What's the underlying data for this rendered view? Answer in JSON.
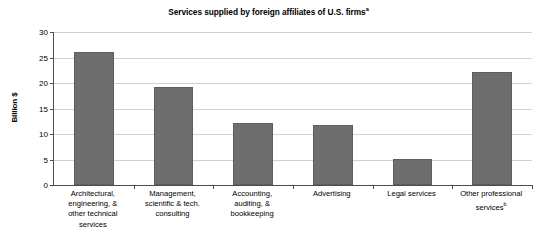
{
  "chart_data": {
    "type": "bar",
    "title": "Services supplied by foreign affiliates of U.S. firms",
    "title_superscript": "a",
    "xlabel": "",
    "ylabel": "Billion $",
    "ylim": [
      0,
      30
    ],
    "ytick_step": 5,
    "yticks": [
      0,
      5,
      10,
      15,
      20,
      25,
      30
    ],
    "ytick_labels": [
      "0",
      "5",
      "10",
      "15",
      "20",
      "25",
      "30"
    ],
    "grid": true,
    "grid_axis": "y",
    "legend": false,
    "legend_position": "none",
    "categories": [
      "Architectural, engineering, & other technical services",
      "Management, scientific & tech. consulting",
      "Accounting, auditing, & bookkeeping",
      "Advertising",
      "Legal services",
      "Other professional services"
    ],
    "category_lines": [
      [
        "Architectural,",
        "engineering, &",
        "other technical",
        "services"
      ],
      [
        "Management,",
        "scientific & tech.",
        "consulting"
      ],
      [
        "Accounting,",
        "auditing, &",
        "bookkeeping"
      ],
      [
        "Advertising"
      ],
      [
        "Legal services"
      ],
      [
        "Other professional",
        "services"
      ]
    ],
    "category_superscripts": [
      "",
      "",
      "",
      "",
      "",
      "b"
    ],
    "values": [
      26.0,
      19.3,
      12.1,
      11.8,
      5.1,
      22.2
    ],
    "bar_color": "#6e6e6e",
    "gridline_color": "#d2d2d2",
    "axis_color": "#4d4d4d",
    "background_color": "#ffffff"
  }
}
